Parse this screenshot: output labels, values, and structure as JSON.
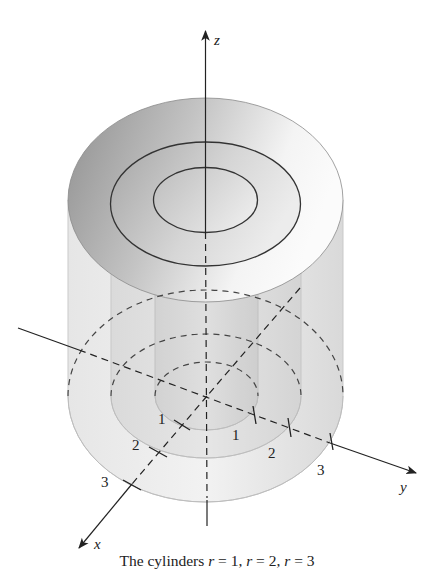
{
  "figure": {
    "caption_prefix": "The cylinders ",
    "caption_parts": [
      {
        "var": "r",
        "eq": " = 1, "
      },
      {
        "var": "r",
        "eq": " = 2, "
      },
      {
        "var": "r",
        "eq": " = 3"
      }
    ],
    "caption_full": "The cylinders r = 1, r = 2, r = 3"
  },
  "axes": {
    "x_label": "x",
    "y_label": "y",
    "z_label": "z"
  },
  "ticks": {
    "x_axis": [
      "1",
      "2",
      "3"
    ],
    "y_axis": [
      "1",
      "2",
      "3"
    ]
  },
  "cylinders": [
    {
      "radius": 1,
      "label": "r = 1"
    },
    {
      "radius": 2,
      "label": "r = 2"
    },
    {
      "radius": 3,
      "label": "r = 3"
    }
  ],
  "colors": {
    "line": "#222222",
    "shade_dark": "#9a9a9a",
    "shade_mid": "#c8c8c8",
    "shade_light": "#eeeeee"
  }
}
